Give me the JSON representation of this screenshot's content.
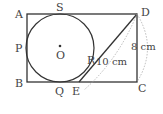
{
  "diagram": {
    "points": {
      "A": "A",
      "B": "B",
      "C": "C",
      "D": "D",
      "S": "S",
      "P": "P",
      "Q": "Q",
      "E": "E",
      "R": "R",
      "O": "O"
    },
    "measurements": {
      "DE": "10 cm",
      "DC": "8 cm"
    },
    "colors": {
      "line": "#333333",
      "dashed": "#999999",
      "text": "#444444"
    }
  }
}
